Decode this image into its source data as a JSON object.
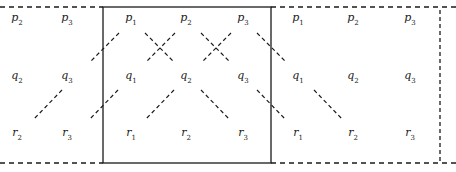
{
  "diagram": {
    "colors": {
      "ink": "#1a1a1a",
      "background": "#ffffff"
    },
    "frame": {
      "top_dashed_y": 7,
      "bottom_dashed_y": 163,
      "right_dashed_x": 440,
      "box": {
        "x": 103,
        "y": 7,
        "width": 168,
        "height": 156
      }
    },
    "rows_y": {
      "p": 19,
      "q": 77,
      "r": 134
    },
    "columns": [
      {
        "x": 17,
        "index": "2"
      },
      {
        "x": 67,
        "index": "3"
      },
      {
        "x": 131,
        "index": "1"
      },
      {
        "x": 186,
        "index": "2"
      },
      {
        "x": 243,
        "index": "3"
      },
      {
        "x": 298,
        "index": "1"
      },
      {
        "x": 353,
        "index": "2"
      },
      {
        "x": 410,
        "index": "3"
      }
    ],
    "labels": [
      {
        "base": "p",
        "sub": "2",
        "x": 17,
        "y": 19
      },
      {
        "base": "p",
        "sub": "3",
        "x": 67,
        "y": 19
      },
      {
        "base": "p",
        "sub": "1",
        "x": 131,
        "y": 19
      },
      {
        "base": "p",
        "sub": "2",
        "x": 186,
        "y": 19
      },
      {
        "base": "p",
        "sub": "3",
        "x": 243,
        "y": 19
      },
      {
        "base": "p",
        "sub": "1",
        "x": 298,
        "y": 19
      },
      {
        "base": "p",
        "sub": "2",
        "x": 353,
        "y": 19
      },
      {
        "base": "p",
        "sub": "3",
        "x": 410,
        "y": 19
      },
      {
        "base": "q",
        "sub": "2",
        "x": 17,
        "y": 77
      },
      {
        "base": "q",
        "sub": "3",
        "x": 67,
        "y": 77
      },
      {
        "base": "q",
        "sub": "1",
        "x": 131,
        "y": 77
      },
      {
        "base": "q",
        "sub": "2",
        "x": 186,
        "y": 77
      },
      {
        "base": "q",
        "sub": "3",
        "x": 243,
        "y": 77
      },
      {
        "base": "q",
        "sub": "1",
        "x": 298,
        "y": 77
      },
      {
        "base": "q",
        "sub": "2",
        "x": 353,
        "y": 77
      },
      {
        "base": "q",
        "sub": "3",
        "x": 410,
        "y": 77
      },
      {
        "base": "r",
        "sub": "2",
        "x": 17,
        "y": 134
      },
      {
        "base": "r",
        "sub": "3",
        "x": 67,
        "y": 134
      },
      {
        "base": "r",
        "sub": "1",
        "x": 131,
        "y": 134
      },
      {
        "base": "r",
        "sub": "2",
        "x": 186,
        "y": 134
      },
      {
        "base": "r",
        "sub": "3",
        "x": 243,
        "y": 134
      },
      {
        "base": "r",
        "sub": "1",
        "x": 298,
        "y": 134
      },
      {
        "base": "r",
        "sub": "2",
        "x": 353,
        "y": 134
      },
      {
        "base": "r",
        "sub": "3",
        "x": 410,
        "y": 134
      }
    ],
    "dashed_edges": [
      {
        "from": "p1",
        "to": "q3 (left copy)",
        "x1": 119,
        "y1": 33,
        "x2": 90,
        "y2": 62
      },
      {
        "from": "p2",
        "to": "q1",
        "x1": 175,
        "y1": 33,
        "x2": 146,
        "y2": 62
      },
      {
        "from": "p1",
        "to": "q2",
        "x1": 145,
        "y1": 33,
        "x2": 174,
        "y2": 62
      },
      {
        "from": "p3",
        "to": "q2",
        "x1": 231,
        "y1": 33,
        "x2": 202,
        "y2": 62
      },
      {
        "from": "p2",
        "to": "q3",
        "x1": 201,
        "y1": 33,
        "x2": 230,
        "y2": 62
      },
      {
        "from": "p3",
        "to": "q1 (right copy)",
        "x1": 257,
        "y1": 33,
        "x2": 286,
        "y2": 62
      },
      {
        "from": "q3 (left copy)",
        "to": "r2 (left copy)",
        "x1": 62,
        "y1": 90,
        "x2": 33,
        "y2": 120
      },
      {
        "from": "q1",
        "to": "r3 (left copy)",
        "x1": 118,
        "y1": 90,
        "x2": 89,
        "y2": 120
      },
      {
        "from": "q2",
        "to": "r1",
        "x1": 174,
        "y1": 90,
        "x2": 145,
        "y2": 120
      },
      {
        "from": "q2",
        "to": "r3",
        "x1": 201,
        "y1": 90,
        "x2": 230,
        "y2": 120
      },
      {
        "from": "q3",
        "to": "r1 (right copy)",
        "x1": 257,
        "y1": 90,
        "x2": 286,
        "y2": 120
      },
      {
        "from": "q1 (right copy)",
        "to": "r2 (right copy)",
        "x1": 314,
        "y1": 90,
        "x2": 343,
        "y2": 120
      }
    ]
  }
}
